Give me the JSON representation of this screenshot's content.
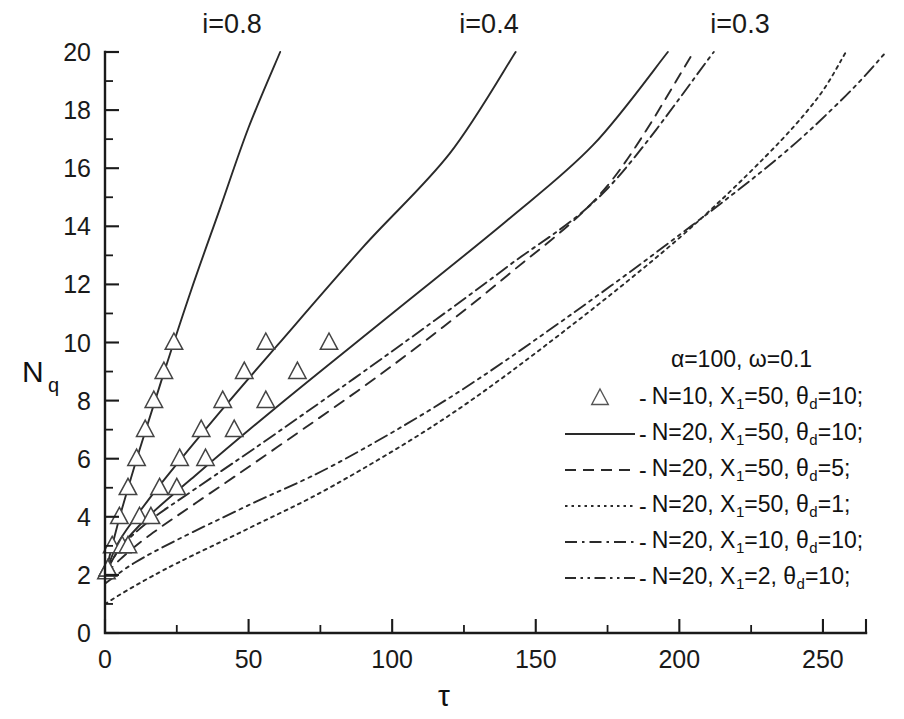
{
  "chart_data": {
    "type": "line",
    "title": "",
    "xlabel": "τ",
    "ylabel": "Nq",
    "ylabel_base": "N",
    "ylabel_sub": "q",
    "xlim": [
      0,
      265
    ],
    "ylim": [
      0,
      20
    ],
    "xticks": [
      0,
      50,
      100,
      150,
      200,
      250
    ],
    "xticklabels": [
      "0",
      "50",
      "100",
      "150",
      "200",
      "250"
    ],
    "yticks": [
      0,
      2,
      4,
      6,
      8,
      10,
      12,
      14,
      16,
      18,
      20
    ],
    "yticklabels": [
      "0",
      "2",
      "4",
      "6",
      "8",
      "10",
      "12",
      "14",
      "16",
      "18",
      "20"
    ],
    "x_minor_step": 25,
    "y_minor_step": 1,
    "grid": false,
    "legend_position": "center-right",
    "annotations": [
      {
        "text": "i=0.8",
        "x": 61,
        "y": 20.9,
        "px": 232,
        "py": 33
      },
      {
        "text": "i=0.4",
        "x": 143,
        "y": 20.9,
        "px": 489,
        "py": 33
      },
      {
        "text": "i=0.3",
        "x": 233,
        "y": 20.9,
        "px": 740,
        "py": 33
      }
    ],
    "series": [
      {
        "name": "N=10, X1=50, theta_d=10 (i=0.8)",
        "style": "markers",
        "marker": "triangle-up",
        "points": [
          {
            "x": 0.5,
            "y": 2.1
          },
          {
            "x": 2.5,
            "y": 3.0
          },
          {
            "x": 5.0,
            "y": 4.0
          },
          {
            "x": 8.0,
            "y": 5.0
          },
          {
            "x": 11.0,
            "y": 6.0
          },
          {
            "x": 14.0,
            "y": 7.0
          },
          {
            "x": 17.0,
            "y": 8.0
          },
          {
            "x": 20.5,
            "y": 9.0
          },
          {
            "x": 24.0,
            "y": 10.0
          }
        ]
      },
      {
        "name": "N=10, X1=50, theta_d=10 (i=0.4)",
        "style": "markers",
        "marker": "triangle-up",
        "points": [
          {
            "x": 1.0,
            "y": 2.2
          },
          {
            "x": 6.0,
            "y": 3.0
          },
          {
            "x": 12.0,
            "y": 4.0
          },
          {
            "x": 19.0,
            "y": 5.0
          },
          {
            "x": 26.0,
            "y": 6.0
          },
          {
            "x": 33.5,
            "y": 7.0
          },
          {
            "x": 41.0,
            "y": 8.0
          },
          {
            "x": 48.5,
            "y": 9.0
          },
          {
            "x": 56.0,
            "y": 10.0
          }
        ]
      },
      {
        "name": "N=10, X1=50, theta_d=10 (i=0.3)",
        "style": "markers",
        "marker": "triangle-up",
        "points": [
          {
            "x": 1.0,
            "y": 2.2
          },
          {
            "x": 8.0,
            "y": 3.0
          },
          {
            "x": 16.0,
            "y": 4.0
          },
          {
            "x": 25.0,
            "y": 5.0
          },
          {
            "x": 35.0,
            "y": 6.0
          },
          {
            "x": 45.0,
            "y": 7.0
          },
          {
            "x": 56.0,
            "y": 8.0
          },
          {
            "x": 67.0,
            "y": 9.0
          },
          {
            "x": 78.0,
            "y": 10.0
          }
        ]
      },
      {
        "name": "N=20, X1=50, theta_d=10 (i=0.8)",
        "style": "solid",
        "points": [
          {
            "x": 0,
            "y": 2.0
          },
          {
            "x": 3,
            "y": 3.2
          },
          {
            "x": 6,
            "y": 4.3
          },
          {
            "x": 12,
            "y": 6.3
          },
          {
            "x": 20,
            "y": 8.8
          },
          {
            "x": 30,
            "y": 11.8
          },
          {
            "x": 40,
            "y": 14.6
          },
          {
            "x": 50,
            "y": 17.4
          },
          {
            "x": 61,
            "y": 20.0
          }
        ]
      },
      {
        "name": "N=20, X1=50, theta_d=10 (i=0.4)",
        "style": "solid",
        "points": [
          {
            "x": 0,
            "y": 2.0
          },
          {
            "x": 4,
            "y": 3.0
          },
          {
            "x": 10,
            "y": 3.9
          },
          {
            "x": 20,
            "y": 5.2
          },
          {
            "x": 40,
            "y": 7.6
          },
          {
            "x": 60,
            "y": 9.9
          },
          {
            "x": 90,
            "y": 13.3
          },
          {
            "x": 120,
            "y": 16.5
          },
          {
            "x": 143,
            "y": 20.0
          }
        ]
      },
      {
        "name": "N=20, X1=50, theta_d=10 (i=0.3)",
        "style": "solid",
        "points": [
          {
            "x": 0,
            "y": 2.0
          },
          {
            "x": 5,
            "y": 2.9
          },
          {
            "x": 15,
            "y": 4.0
          },
          {
            "x": 30,
            "y": 5.3
          },
          {
            "x": 60,
            "y": 7.8
          },
          {
            "x": 100,
            "y": 11.0
          },
          {
            "x": 140,
            "y": 14.2
          },
          {
            "x": 170,
            "y": 16.8
          },
          {
            "x": 196,
            "y": 20.0
          }
        ]
      },
      {
        "name": "N=20, X1=50, theta_d=5",
        "style": "dashed",
        "points": [
          {
            "x": 0,
            "y": 2.0
          },
          {
            "x": 6,
            "y": 2.6
          },
          {
            "x": 16,
            "y": 3.4
          },
          {
            "x": 32,
            "y": 4.5
          },
          {
            "x": 60,
            "y": 6.4
          },
          {
            "x": 100,
            "y": 9.2
          },
          {
            "x": 140,
            "y": 12.3
          },
          {
            "x": 175,
            "y": 15.4
          },
          {
            "x": 205,
            "y": 20.0
          }
        ]
      },
      {
        "name": "N=20, X1=50, theta_d=1",
        "style": "dotted",
        "points": [
          {
            "x": 0,
            "y": 1.0
          },
          {
            "x": 10,
            "y": 1.6
          },
          {
            "x": 25,
            "y": 2.4
          },
          {
            "x": 50,
            "y": 3.6
          },
          {
            "x": 80,
            "y": 5.1
          },
          {
            "x": 120,
            "y": 7.5
          },
          {
            "x": 160,
            "y": 10.4
          },
          {
            "x": 200,
            "y": 13.6
          },
          {
            "x": 230,
            "y": 16.4
          },
          {
            "x": 248,
            "y": 18.4
          },
          {
            "x": 258,
            "y": 20.0
          }
        ]
      },
      {
        "name": "N=20, X1=10, theta_d=10",
        "style": "dashdot",
        "points": [
          {
            "x": 0,
            "y": 2.1
          },
          {
            "x": 6,
            "y": 3.0
          },
          {
            "x": 16,
            "y": 3.9
          },
          {
            "x": 32,
            "y": 5.0
          },
          {
            "x": 60,
            "y": 6.9
          },
          {
            "x": 100,
            "y": 9.7
          },
          {
            "x": 140,
            "y": 12.6
          },
          {
            "x": 175,
            "y": 15.3
          },
          {
            "x": 212,
            "y": 20.0
          }
        ]
      },
      {
        "name": "N=20, X1=2, theta_d=10",
        "style": "dashdotdot",
        "points": [
          {
            "x": 0,
            "y": 1.7
          },
          {
            "x": 10,
            "y": 2.4
          },
          {
            "x": 25,
            "y": 3.2
          },
          {
            "x": 50,
            "y": 4.4
          },
          {
            "x": 80,
            "y": 5.8
          },
          {
            "x": 120,
            "y": 8.1
          },
          {
            "x": 160,
            "y": 10.8
          },
          {
            "x": 200,
            "y": 13.7
          },
          {
            "x": 235,
            "y": 16.4
          },
          {
            "x": 258,
            "y": 18.5
          },
          {
            "x": 272,
            "y": 20.0
          }
        ]
      }
    ],
    "legend": {
      "header": "α=100, ω=0.1",
      "header_parts": {
        "alpha_symbol": "α",
        "alpha_value": "100",
        "omega_symbol": "ω",
        "omega_value": "0.1"
      },
      "entries": [
        {
          "sample": "triangle-up",
          "dash": "-",
          "n_label": "N=10,",
          "x_label": "X",
          "x_sub": "1",
          "x_value": "=50,",
          "theta_label": "θ",
          "theta_sub": "d",
          "theta_value": "=10;"
        },
        {
          "sample": "solid",
          "dash": "-",
          "n_label": "N=20,",
          "x_label": "X",
          "x_sub": "1",
          "x_value": "=50,",
          "theta_label": "θ",
          "theta_sub": "d",
          "theta_value": "=10;"
        },
        {
          "sample": "dashed",
          "dash": "-",
          "n_label": "N=20,",
          "x_label": "X",
          "x_sub": "1",
          "x_value": "=50,",
          "theta_label": "θ",
          "theta_sub": "d",
          "theta_value": "=5;"
        },
        {
          "sample": "dotted",
          "dash": "-",
          "n_label": "N=20,",
          "x_label": "X",
          "x_sub": "1",
          "x_value": "=50,",
          "theta_label": "θ",
          "theta_sub": "d",
          "theta_value": "=1;"
        },
        {
          "sample": "dashdot",
          "dash": "-",
          "n_label": "N=20,",
          "x_label": "X",
          "x_sub": "1",
          "x_value": "=10,",
          "theta_label": "θ",
          "theta_sub": "d",
          "theta_value": "=10;"
        },
        {
          "sample": "dashdotdot",
          "dash": "-",
          "n_label": "N=20,",
          "x_label": "X",
          "x_sub": "1",
          "x_value": "=2,",
          "theta_label": "θ",
          "theta_sub": "d",
          "theta_value": "=10;"
        }
      ]
    },
    "colors": {
      "line": "#2a2a2a",
      "axis": "#1a1a1a",
      "text": "#111111",
      "background": "#ffffff"
    }
  }
}
